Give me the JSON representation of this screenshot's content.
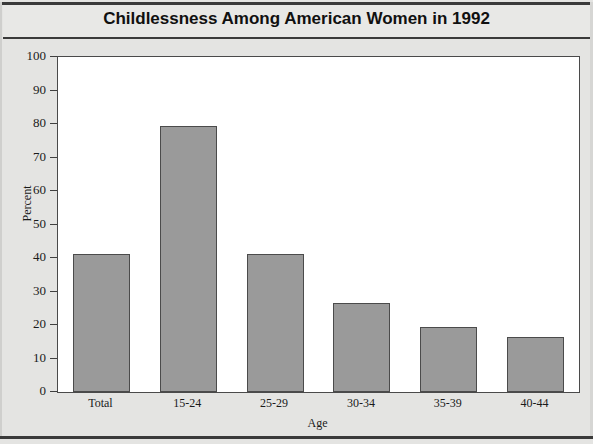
{
  "chart_data": {
    "type": "bar",
    "title": "Childlessness Among American Women in 1992",
    "xlabel": "Age",
    "ylabel": "Percent",
    "categories": [
      "Total",
      "15-24",
      "25-29",
      "30-34",
      "35-39",
      "40-44"
    ],
    "values": [
      41.2,
      79.3,
      41.3,
      26.5,
      19.4,
      16.4
    ],
    "ylim": [
      0,
      100
    ],
    "yticks": [
      0,
      10,
      20,
      30,
      40,
      50,
      60,
      70,
      80,
      90,
      100
    ],
    "ytick_labels": [
      "0",
      "10",
      "20",
      "30",
      "40",
      "50",
      "60",
      "70",
      "80",
      "90",
      "100"
    ],
    "grid": false,
    "legend": null,
    "bar_color": "#9a9a9a",
    "bar_edge_color": "#4b4b4b",
    "plot_background": "#ffffff",
    "figure_background": "#e4e4e2"
  }
}
